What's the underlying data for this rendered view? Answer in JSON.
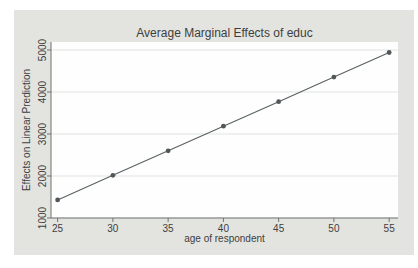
{
  "page": {
    "background": "#ffffff"
  },
  "graph": {
    "background": "#e3e4e0",
    "plot_background": "#fefefe"
  },
  "chart_data": {
    "type": "line",
    "title": "Average Marginal Effects of educ",
    "xlabel": "age of respondent",
    "ylabel": "Effects on Linear Prediction",
    "x": [
      25,
      30,
      35,
      40,
      45,
      50,
      55
    ],
    "series": [
      {
        "name": "Average Marginal Effects of educ",
        "values": [
          1430,
          2015,
          2600,
          3185,
          3770,
          4355,
          4940
        ]
      }
    ],
    "xticks": [
      25,
      30,
      35,
      40,
      45,
      50,
      55
    ],
    "yticks": [
      1000,
      2000,
      3000,
      4000,
      5000
    ],
    "xlim": [
      24.4,
      55.8
    ],
    "ylim": [
      1000,
      5190
    ],
    "grid": "horizontal",
    "legend": "none",
    "line_color": "#5a6163",
    "marker": "circle",
    "marker_color": "#515759",
    "gridline_color": "#e0e4e1",
    "axis_color": "#6e7270",
    "text_color": "#3e3e3e"
  }
}
